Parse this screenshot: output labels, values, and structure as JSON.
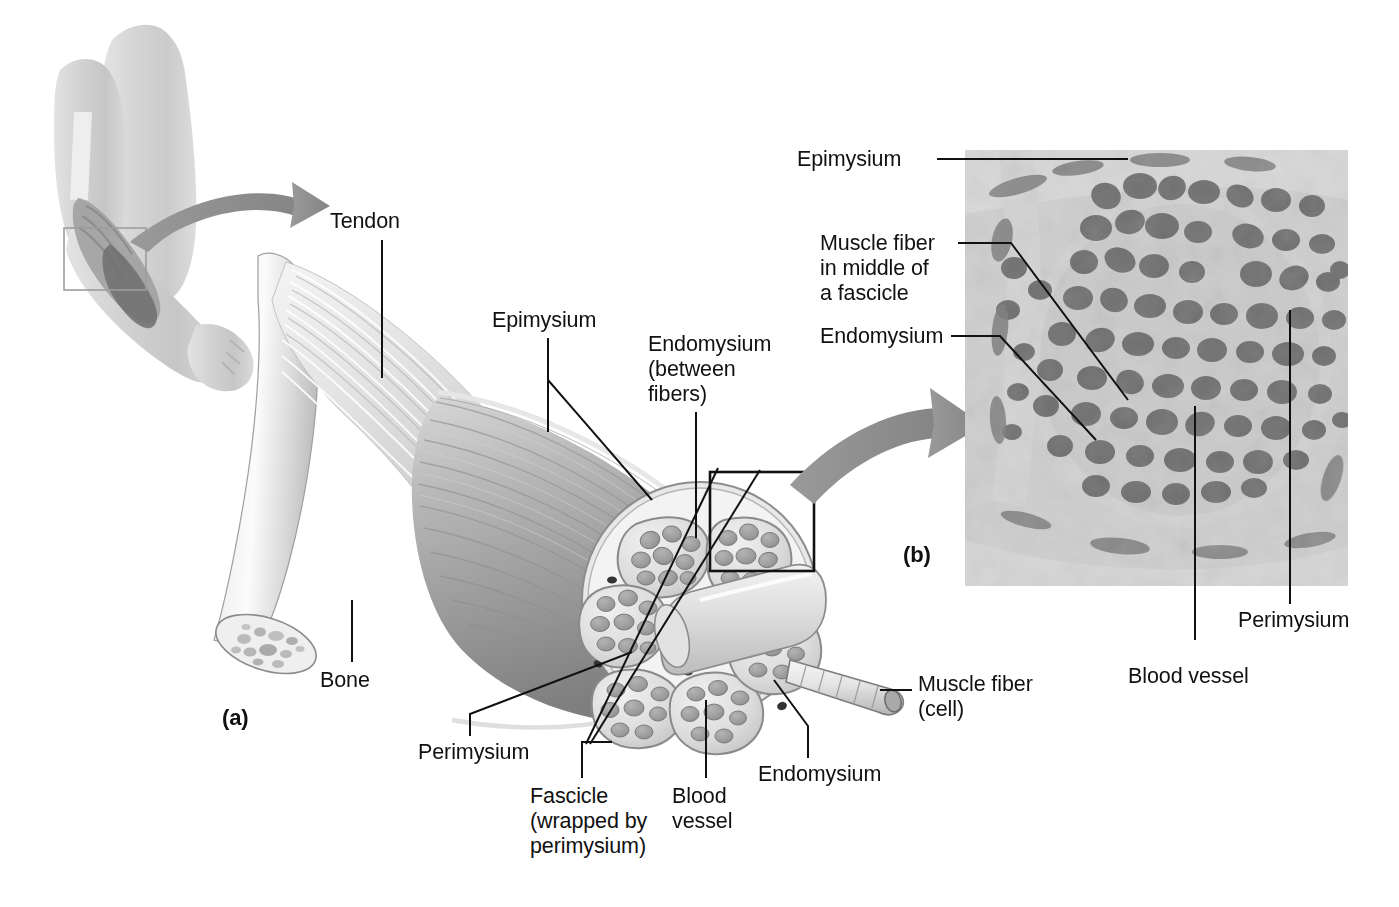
{
  "figure": {
    "background_color": "#ffffff",
    "ink_color": "#111111",
    "arrow_color": "#8f8f8f"
  },
  "panels": {
    "a": {
      "marker": "(a)",
      "description": "Illustration of a skeletal muscle with tendon, epimysium, fascicles and muscle fibers"
    },
    "b": {
      "marker": "(b)",
      "description": "Light micrograph of a muscle in cross section"
    }
  },
  "inset": {
    "name": "arm-inset",
    "description": "Human arm with biceps brachii highlighted and a selection box over the distal muscle"
  },
  "labels": {
    "tendon": "Tendon",
    "epimysium_a": "Epimysium",
    "endomysium_between_fibers": "Endomysium\n(between\nfibers)",
    "endomysium_a": "Endomysium",
    "bone": "Bone",
    "perimysium_a": "Perimysium",
    "fascicle": "Fascicle\n(wrapped by\nperimysium)",
    "blood_vessel_a": "Blood\nvessel",
    "muscle_fiber_cell": "Muscle fiber\n(cell)",
    "epimysium_b": "Epimysium",
    "muscle_fiber_in_middle": "Muscle fiber\nin middle of\na fascicle",
    "endomysium_b": "Endomysium",
    "perimysium_b": "Perimysium",
    "blood_vessel_b": "Blood vessel"
  }
}
